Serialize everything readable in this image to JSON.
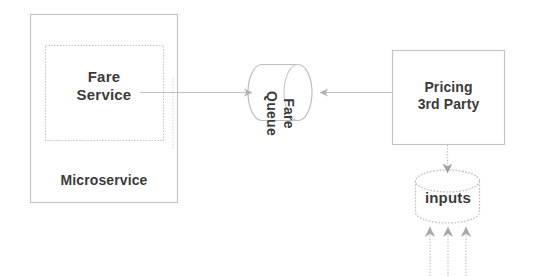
{
  "diagram": {
    "background_color": "#ffffff",
    "stroke_color": "#b9b9b9",
    "text_color": "#3b3b3b",
    "nodes": {
      "microservice_boundary": {
        "label": "Microservice",
        "shape": "rectangle"
      },
      "fare_service": {
        "label": "Fare\nService",
        "shape": "rectangle"
      },
      "fare_queue": {
        "label": "Fare\nQueue",
        "shape": "cylinder-horizontal",
        "text_orientation": "rotated-90-clockwise"
      },
      "pricing_third_party": {
        "label": "Pricing\n3rd Party",
        "shape": "rectangle"
      },
      "inputs_store": {
        "label": "inputs",
        "shape": "cylinder-vertical"
      }
    },
    "edges": [
      {
        "name": "fare-service-to-fare-queue",
        "from": "fare_service",
        "to": "fare_queue",
        "direction": "right",
        "arrowhead": "end"
      },
      {
        "name": "pricing-to-fare-queue",
        "from": "pricing_third_party",
        "to": "fare_queue",
        "direction": "left",
        "arrowhead": "end"
      },
      {
        "name": "pricing-to-inputs",
        "from": "pricing_third_party",
        "to": "inputs_store",
        "direction": "down",
        "arrowhead": "end"
      },
      {
        "name": "input-feed-1",
        "from": "external",
        "to": "inputs_store",
        "direction": "up",
        "arrowhead": "end"
      },
      {
        "name": "input-feed-2",
        "from": "external",
        "to": "inputs_store",
        "direction": "up",
        "arrowhead": "end"
      },
      {
        "name": "input-feed-3",
        "from": "external",
        "to": "inputs_store",
        "direction": "up",
        "arrowhead": "end"
      }
    ]
  }
}
